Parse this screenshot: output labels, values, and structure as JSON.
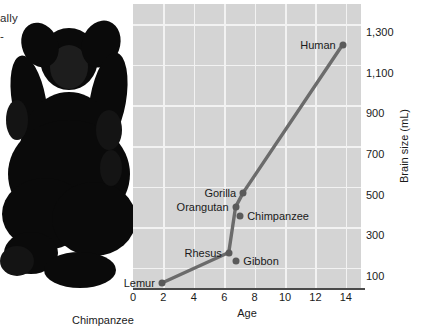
{
  "figure": {
    "fragment_text_line1": "ally",
    "fragment_text_line2": "-",
    "photo_caption": "Chimpanzee",
    "photo_subject": "chimpanzee-photo"
  },
  "chart_data": {
    "type": "line",
    "title": "",
    "xlabel": "Age",
    "ylabel": "Brain size (mL)",
    "xlim": [
      0,
      15
    ],
    "ylim": [
      0,
      1400
    ],
    "xticks": [
      0,
      2,
      4,
      6,
      8,
      10,
      12,
      14
    ],
    "xtick_labels": [
      "0",
      "2",
      "4",
      "6",
      "8",
      "10",
      "12",
      "14"
    ],
    "yticks": [
      100,
      300,
      500,
      700,
      900,
      1100,
      1300
    ],
    "ytick_labels": [
      "100",
      "300",
      "500",
      "700",
      "900",
      "1,100",
      "1,300"
    ],
    "grid": true,
    "legend": "none",
    "series": [
      {
        "name": "Primate brain growth",
        "points": [
          {
            "label": "Lemur",
            "x": 1.9,
            "y": 25,
            "label_pos": "left"
          },
          {
            "label": "Rhesus",
            "x": 6.3,
            "y": 175,
            "label_pos": "left"
          },
          {
            "label": "Gibbon",
            "x": 6.8,
            "y": 135,
            "label_pos": "right",
            "off_curve": true
          },
          {
            "label": "Orangutan",
            "x": 6.75,
            "y": 400,
            "label_pos": "left"
          },
          {
            "label": "Chimpanzee",
            "x": 7.05,
            "y": 355,
            "label_pos": "right",
            "off_curve": true
          },
          {
            "label": "Gorilla",
            "x": 7.25,
            "y": 470,
            "label_pos": "left"
          },
          {
            "label": "Human",
            "x": 13.8,
            "y": 1200,
            "label_pos": "left"
          }
        ]
      }
    ],
    "line_color": "#6b6b6b",
    "marker_color": "#5a5a5a",
    "plot_background": "#d4d4d4",
    "grid_color": "#f2f2f2"
  }
}
